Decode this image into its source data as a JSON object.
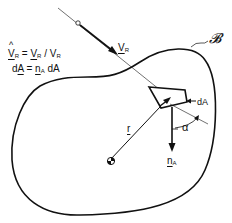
{
  "equations": {
    "line1": {
      "lhs": "V",
      "lhs_sub": "R",
      "equals": "=",
      "rhs_num": "V",
      "rhs_num_sub": "R",
      "slash": "/",
      "rhs_den": "V",
      "rhs_den_sub": "R",
      "hat": "^"
    },
    "line2": {
      "lhs": "dA",
      "equals": "=",
      "rhs_vec": "n",
      "rhs_vec_sub": "A",
      "rhs_tail": "dA"
    }
  },
  "labels": {
    "velocity": "V",
    "velocity_sub": "R",
    "body": "𝓑",
    "area_element": "dA",
    "angle": "α",
    "position": "r",
    "normal": "n",
    "normal_sub": "A"
  },
  "colors": {
    "stroke": "#111111",
    "background": "#ffffff"
  }
}
